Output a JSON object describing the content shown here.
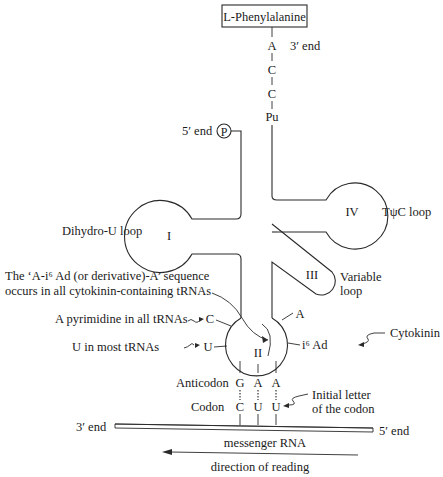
{
  "amino_acid": {
    "label": "L-Phenylalanine"
  },
  "acceptor_stem": {
    "bases": [
      "A",
      "C",
      "C",
      "Pu"
    ],
    "three_prime_label": "3′ end"
  },
  "five_prime": {
    "label": "5′ end",
    "phosphate": "P"
  },
  "loops": {
    "I": {
      "numeral": "I",
      "label": "Dihydro-U loop"
    },
    "II": {
      "numeral": "II"
    },
    "III": {
      "numeral": "III",
      "label_line1": "Variable",
      "label_line2": "loop"
    },
    "IV": {
      "numeral": "IV",
      "label": "TψC loop"
    }
  },
  "annotations": {
    "sequence_line1": "The ‘A-i⁶ Ad (or derivative)-A’ sequence",
    "sequence_line2": "occurs in all cytokinin-containing tRNAs",
    "pyrimidine": "A pyrimidine in all tRNAs",
    "u_most": "U in most tRNAs",
    "cytokinin": "Cytokinin",
    "initial_line1": "Initial letter",
    "initial_line2": "of the codon"
  },
  "anticodon_loop_bases": {
    "C": "C",
    "U": "U",
    "A": "A",
    "i6Ad": "i⁶ Ad"
  },
  "pairing": {
    "anticodon_label": "Anticodon",
    "codon_label": "Codon",
    "anticodon": [
      "G",
      "A",
      "A"
    ],
    "codon": [
      "C",
      "U",
      "U"
    ]
  },
  "mrna": {
    "label": "messenger RNA",
    "left_end": "3′ end",
    "right_end": "5′ end"
  },
  "direction": {
    "label": "direction of reading"
  }
}
